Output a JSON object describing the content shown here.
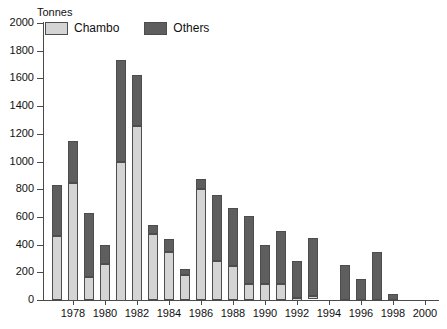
{
  "chart_data": {
    "type": "bar",
    "title": "",
    "subtitle": "",
    "xlabel": "",
    "ylabel": "Tonnes",
    "stacked": true,
    "grid": false,
    "legend_position": "top-left",
    "ylim": [
      0,
      2000
    ],
    "xlim": [
      1976.2,
      2000.8
    ],
    "ytick_labels": [
      "2000",
      "1800",
      "1600",
      "1400",
      "1200",
      "1000",
      "800",
      "600",
      "400",
      "200",
      "0"
    ],
    "ytick_values": [
      2000,
      1800,
      1600,
      1400,
      1200,
      1000,
      800,
      600,
      400,
      200,
      0
    ],
    "xtick_labels": [
      "1978",
      "1980",
      "1982",
      "1984",
      "1986",
      "1988",
      "1990",
      "1992",
      "1994",
      "1996",
      "1998",
      "2000"
    ],
    "xtick_values": [
      1978,
      1980,
      1982,
      1984,
      1986,
      1988,
      1990,
      1992,
      1994,
      1996,
      1998,
      2000
    ],
    "categories": [
      1977,
      1978,
      1979,
      1980,
      1981,
      1982,
      1983,
      1984,
      1985,
      1986,
      1987,
      1988,
      1989,
      1990,
      1991,
      1992,
      1993,
      1995,
      1996,
      1997,
      1998
    ],
    "series": [
      {
        "name": "Chambo",
        "color": "#d4d4d4",
        "values": [
          460,
          850,
          165,
          265,
          1000,
          1260,
          475,
          345,
          180,
          800,
          285,
          245,
          115,
          120,
          115,
          20,
          25,
          0,
          0,
          0,
          0
        ]
      },
      {
        "name": "Others",
        "color": "#5e5e5e",
        "values": [
          370,
          300,
          460,
          135,
          735,
          365,
          65,
          95,
          45,
          75,
          475,
          420,
          490,
          280,
          385,
          265,
          420,
          255,
          155,
          345,
          45
        ]
      }
    ],
    "totals": [
      830,
      1150,
      625,
      400,
      1735,
      1625,
      540,
      440,
      225,
      875,
      760,
      665,
      605,
      400,
      500,
      285,
      445,
      255,
      155,
      345,
      45
    ]
  },
  "legend": {
    "unit_label": "Tonnes",
    "entries": [
      {
        "label": "Chambo",
        "swatch": "chambo"
      },
      {
        "label": "Others",
        "swatch": "others"
      }
    ]
  }
}
